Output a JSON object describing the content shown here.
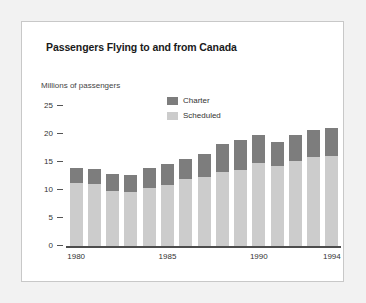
{
  "figure": {
    "title": "Passengers Flying to and from Canada",
    "background": "#ffffff",
    "border_color": "#c8c8c8",
    "page_background": "#f2f2f2"
  },
  "legend": {
    "position": "inside-top-center",
    "entries": [
      {
        "label": "Charter",
        "color": "#7d7d7d"
      },
      {
        "label": "Scheduled",
        "color": "#cccccc"
      }
    ]
  },
  "chart_data": {
    "type": "bar",
    "stacked": true,
    "title": "Passengers Flying to and from Canada",
    "xlabel": "",
    "ylabel": "Millions of passengers",
    "ylim": [
      0,
      25
    ],
    "yticks": [
      0,
      5,
      10,
      15,
      20,
      25
    ],
    "ytick_labels": [
      "0",
      "5",
      "10",
      "15",
      "20",
      "25"
    ],
    "grid": false,
    "legend_position": "inside-top-center",
    "categories": [
      "1980",
      "1981",
      "1982",
      "1983",
      "1984",
      "1985",
      "1986",
      "1987",
      "1988",
      "1989",
      "1990",
      "1991",
      "1992",
      "1993",
      "1994"
    ],
    "xtick_labels": [
      "1980",
      "1985",
      "1990",
      "1994"
    ],
    "xtick_categories": [
      "1980",
      "1985",
      "1990",
      "1994"
    ],
    "series": [
      {
        "name": "Scheduled",
        "color": "#cccccc",
        "values": [
          11.2,
          11.0,
          9.9,
          9.6,
          10.4,
          10.9,
          12.0,
          12.3,
          13.3,
          13.6,
          14.8,
          14.2,
          15.1,
          15.9,
          16.1
        ]
      },
      {
        "name": "Charter",
        "color": "#7d7d7d",
        "values": [
          2.7,
          2.7,
          2.9,
          3.1,
          3.6,
          3.8,
          3.6,
          4.2,
          4.9,
          5.4,
          5.1,
          4.4,
          4.8,
          4.9,
          5.0
        ]
      }
    ],
    "totals": [
      13.9,
      13.7,
      12.8,
      12.7,
      14.0,
      14.7,
      15.6,
      16.5,
      18.2,
      19.0,
      19.9,
      18.6,
      19.9,
      20.8,
      21.1
    ]
  }
}
